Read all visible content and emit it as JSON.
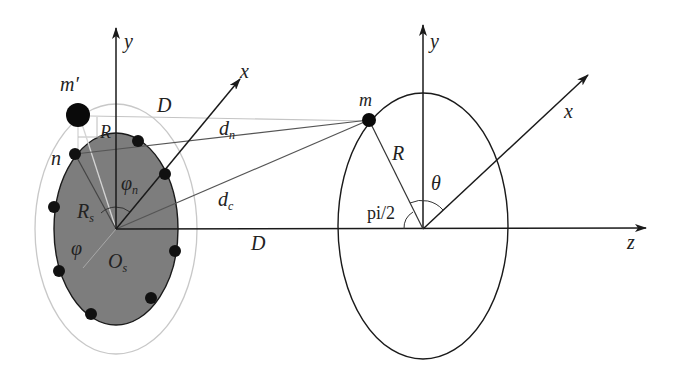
{
  "diagram": {
    "left_frame": {
      "origin_label": "O",
      "origin_sub": "s",
      "axis_y": "y",
      "axis_x": "x",
      "radius_label": "R",
      "radius_sub": "s",
      "angle_phi": "φ",
      "angle_phin": "φ",
      "angle_phin_sub": "n",
      "point_n": "n",
      "point_mprime": "m′",
      "offset_R": "R",
      "distance_D_top": "D"
    },
    "connections": {
      "d_n": "d",
      "d_n_sub": "n",
      "d_c": "d",
      "d_c_sub": "c",
      "distance_D_axis": "D"
    },
    "right_frame": {
      "axis_y": "y",
      "axis_x": "x",
      "axis_z": "z",
      "point_m": "m",
      "radius_label": "R",
      "angle_theta": "θ",
      "angle_right": "pi/2"
    },
    "colors": {
      "ink": "#1a1a1a",
      "fill_ellipse": "#7a7a7a",
      "outer_ellipse": "#c8c8c8",
      "helper_lines": "#bdbdbd"
    }
  }
}
